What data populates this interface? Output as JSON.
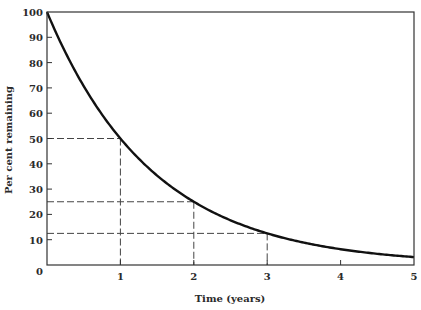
{
  "chart_data": {
    "type": "line",
    "title": "",
    "xlabel": "Time (years)",
    "ylabel": "Per cent remaining",
    "xlim": [
      0,
      5
    ],
    "ylim": [
      0,
      100
    ],
    "x_ticks": [
      1,
      2,
      3,
      4,
      5
    ],
    "y_ticks": [
      0,
      10,
      20,
      30,
      40,
      50,
      60,
      70,
      80,
      90,
      100
    ],
    "x_tick_labels": [
      "1",
      "2",
      "3",
      "4",
      "5"
    ],
    "y_tick_labels": [
      "0",
      "10",
      "20",
      "30",
      "40",
      "50",
      "60",
      "70",
      "80",
      "90",
      "100"
    ],
    "grid": false,
    "legend": null,
    "series": [
      {
        "name": "Per cent remaining",
        "x": [
          0,
          0.5,
          1,
          1.5,
          2,
          2.5,
          3,
          3.5,
          4,
          4.5,
          5
        ],
        "values": [
          100,
          70.7,
          50,
          35.4,
          25,
          17.7,
          12.5,
          8.8,
          6.25,
          4.4,
          3.1
        ]
      }
    ],
    "annotations": [
      {
        "type": "dashed-guide",
        "x": 1,
        "y": 50
      },
      {
        "type": "dashed-guide",
        "x": 2,
        "y": 25
      },
      {
        "type": "dashed-guide",
        "x": 3,
        "y": 12.5
      }
    ],
    "half_life_years": 1
  }
}
